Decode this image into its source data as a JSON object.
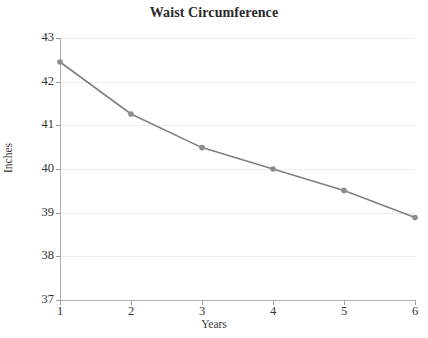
{
  "chart_data": {
    "type": "line",
    "title": "Waist Circumference",
    "xlabel": "Years",
    "ylabel": "Inches",
    "x": [
      1,
      2,
      3,
      4,
      5,
      6
    ],
    "xtick_labels": [
      "1",
      "2",
      "3",
      "4",
      "5",
      "6"
    ],
    "ytick_labels": [
      "37",
      "38",
      "39",
      "40",
      "41",
      "42",
      "43"
    ],
    "yticks": [
      37,
      38,
      39,
      40,
      41,
      42,
      43
    ],
    "ylim": [
      37,
      43
    ],
    "xlim": [
      1,
      6
    ],
    "grid": "horizontal",
    "legend": "none",
    "series": [
      {
        "name": "Waist Circumference",
        "values": [
          42.45,
          41.26,
          40.49,
          40.0,
          39.51,
          38.89
        ],
        "line_color": "#808080",
        "marker_color": "#8c8c8c",
        "marker": "circle"
      }
    ]
  },
  "style": {
    "background": "#ffffff",
    "gridline_color": "#ececed",
    "axis_color": "#b0b0b0",
    "text_color": "#333333",
    "title_color": "#2b2b2b"
  }
}
